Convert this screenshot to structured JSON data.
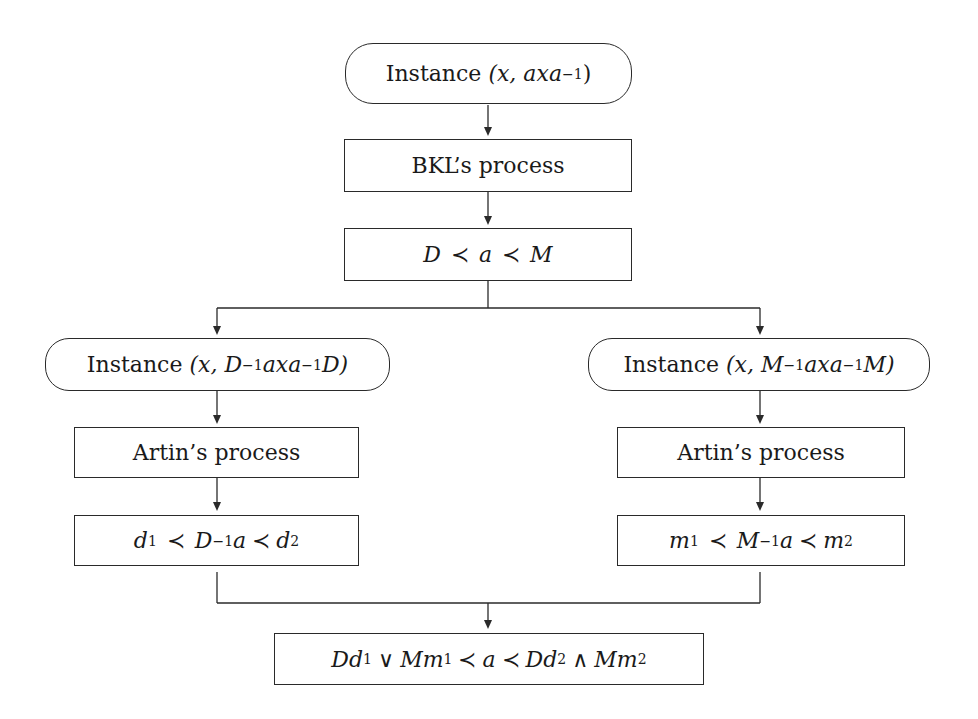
{
  "diagram": {
    "nodes": {
      "start": {
        "text": "Instance (x, axa⁻¹)",
        "prefix": "Instance",
        "args": "(x, axa",
        "exp": "−1",
        "close": ")"
      },
      "bkl": {
        "text": "BKL's process",
        "label": "BKL’s process"
      },
      "bkl_result": {
        "text": "D ≺ a ≺ M",
        "left": "D",
        "rel": "≺",
        "mid": "a",
        "right": "M"
      },
      "left_instance": {
        "text": "Instance (x, D⁻¹axa⁻¹D)",
        "prefix": "Instance",
        "open": "(x, D",
        "exp1": "−1",
        "mid": "axa",
        "exp2": "−1",
        "tail": "D)"
      },
      "right_instance": {
        "text": "Instance (x, M⁻¹axa⁻¹M)",
        "prefix": "Instance",
        "open": "(x, M",
        "exp1": "−1",
        "mid": "axa",
        "exp2": "−1",
        "tail": "M)"
      },
      "left_artin": {
        "text": "Artin's process",
        "label": "Artin’s process"
      },
      "right_artin": {
        "text": "Artin's process",
        "label": "Artin’s process"
      },
      "left_result": {
        "text": "d₁ ≺ D⁻¹a ≺ d₂",
        "v1": "d",
        "s1": "1",
        "rel": "≺",
        "base": "D",
        "exp": "−1",
        "a": "a",
        "v2": "d",
        "s2": "2"
      },
      "right_result": {
        "text": "m₁ ≺ M⁻¹a ≺ m₂",
        "v1": "m",
        "s1": "1",
        "rel": "≺",
        "base": "M",
        "exp": "−1",
        "a": "a",
        "v2": "m",
        "s2": "2"
      },
      "final": {
        "text": "Dd₁ ∨ Mm₁ ≺ a ≺ Dd₂ ∧ Mm₂",
        "t1": "Dd",
        "s1": "1",
        "or": "∨",
        "t2": "Mm",
        "s2": "1",
        "rel": "≺",
        "a": "a",
        "t3": "Dd",
        "s3": "2",
        "and": "∧",
        "t4": "Mm",
        "s4": "2"
      }
    },
    "edges": [
      {
        "from": "start",
        "to": "bkl"
      },
      {
        "from": "bkl",
        "to": "bkl_result"
      },
      {
        "from": "bkl_result",
        "to": "left_instance"
      },
      {
        "from": "bkl_result",
        "to": "right_instance"
      },
      {
        "from": "left_instance",
        "to": "left_artin"
      },
      {
        "from": "right_instance",
        "to": "right_artin"
      },
      {
        "from": "left_artin",
        "to": "left_result"
      },
      {
        "from": "right_artin",
        "to": "right_result"
      },
      {
        "from": "left_result",
        "to": "final"
      },
      {
        "from": "right_result",
        "to": "final"
      }
    ],
    "colors": {
      "stroke": "#2a2a2a",
      "background": "#ffffff",
      "text": "#1a1a1a"
    }
  }
}
